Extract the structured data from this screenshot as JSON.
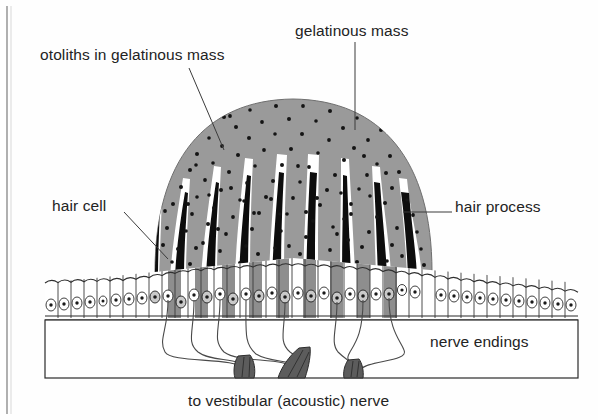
{
  "figure": {
    "title_caption": "to vestibular (acoustic) nerve"
  },
  "labels": {
    "otoliths": "otoliths in gelatinous mass",
    "gelatinous_mass": "gelatinous mass",
    "hair_cell": "hair cell",
    "hair_process": "hair process",
    "nerve_endings": "nerve endings",
    "caption": "to vestibular (acoustic) nerve"
  },
  "colors": {
    "background": "#fefefe",
    "gelatinous_fill": "#9a9a9a",
    "otolith_dot": "#141414",
    "hair_process_fill": "#0d0d0d",
    "hair_process_outline": "#ffffff",
    "hair_cell_fill": "#8e8e8e",
    "support_cell_fill": "#ffffff",
    "outline": "#2a2a2a",
    "nerve_bundle_fill": "#5c5c5c",
    "nerve_fiber": "#4a4a4a",
    "text": "#232323",
    "page_edge": "#8e8e8e"
  },
  "structure": {
    "gelatinous_dome": {
      "left": 155,
      "right": 432,
      "top": 98,
      "baseline": 272,
      "otolith_dot_count": 185
    },
    "hair_processes": {
      "count": 9,
      "description": "black tapered spikes with white outlines radiating from hair cells into the gelatinous mass"
    },
    "epithelium": {
      "left": 45,
      "right": 578,
      "cell_count": 42,
      "hair_cell_indices": [
        14,
        16,
        18,
        20,
        22,
        24,
        26,
        28,
        30
      ],
      "apex_x": 293,
      "apex_y": 258,
      "basement_y": 318
    },
    "nerve_bundles": {
      "count": 3,
      "x_positions": [
        243,
        300,
        352
      ],
      "base_y": 378
    },
    "nerve_fibers": {
      "count": 8
    }
  }
}
